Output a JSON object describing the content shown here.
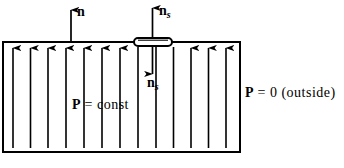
{
  "figure": {
    "type": "physics-vector-diagram",
    "canvas": {
      "width": 344,
      "height": 168,
      "background": "#ffffff"
    },
    "stroke_color": "#000000",
    "slab": {
      "name": "dielectric-slab",
      "x": 3,
      "y": 42,
      "width": 237,
      "height": 110,
      "border_width": 2,
      "fill": "none"
    },
    "pillbox": {
      "name": "gaussian-pillbox",
      "x": 133,
      "y": 37,
      "width": 40,
      "height": 9,
      "shape": "flattened-rounded-rectangle",
      "border_width": 2
    },
    "polarization_arrows": {
      "count": 13,
      "x_positions": [
        13,
        30.5,
        48,
        66,
        84,
        102,
        120,
        138,
        156,
        173.5,
        191,
        208.5,
        226
      ],
      "y_top": 46,
      "y_bottom": 148,
      "headed": [
        true,
        true,
        true,
        true,
        true,
        true,
        true,
        false,
        false,
        false,
        true,
        true,
        true
      ],
      "head_y": 48,
      "direction": "up"
    },
    "external_arrows": [
      {
        "name": "normal-vector-n",
        "x": 71,
        "y_tail": 42,
        "y_head": 8,
        "direction": "up"
      },
      {
        "name": "surface-normal-up",
        "x": 152.5,
        "y_tail": 38,
        "y_head": 6,
        "direction": "up"
      },
      {
        "name": "surface-normal-down",
        "x": 152.5,
        "y_tail": 46,
        "y_head": 76,
        "direction": "down"
      }
    ]
  },
  "labels": {
    "n_vector": "n",
    "ns_top_base": "n",
    "ns_top_sub": "s",
    "ns_bottom_base": "n",
    "ns_bottom_sub": "s",
    "p_const_symbol": "P",
    "p_const_rest": " = const",
    "p_outside_symbol": "P",
    "p_outside_rest": " = 0 (outside)"
  }
}
